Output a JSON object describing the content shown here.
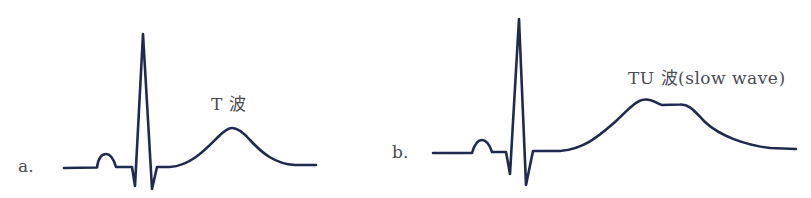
{
  "figure": {
    "stroke_color": "#1e2a4f",
    "text_color": "#4a4a52",
    "panels": [
      {
        "id": "a",
        "letter": "a.",
        "wave_label": "T 波",
        "description": "Normal ECG complex with T wave"
      },
      {
        "id": "b",
        "letter": "b.",
        "wave_label": "TU 波(slow wave)",
        "description": "ECG complex with merged TU wave (slow wave)"
      }
    ]
  }
}
